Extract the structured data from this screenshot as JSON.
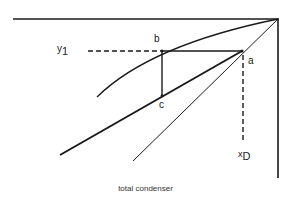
{
  "diagram": {
    "caption": "total condenser",
    "labels": {
      "a": "a",
      "b": "b",
      "c": "c",
      "y1_main": "y",
      "y1_sub": "1",
      "xD_main": "x",
      "xD_sub": "D"
    },
    "elements": [
      "top boundary line",
      "right boundary line",
      "equilibrium curve",
      "diagonal (y = x) line",
      "operating line",
      "horizontal step a-b",
      "vertical step b-c",
      "dashed y1 guide",
      "dashed xD guide"
    ],
    "colors": {
      "line": "#1a1a1a",
      "text": "#222222"
    }
  }
}
